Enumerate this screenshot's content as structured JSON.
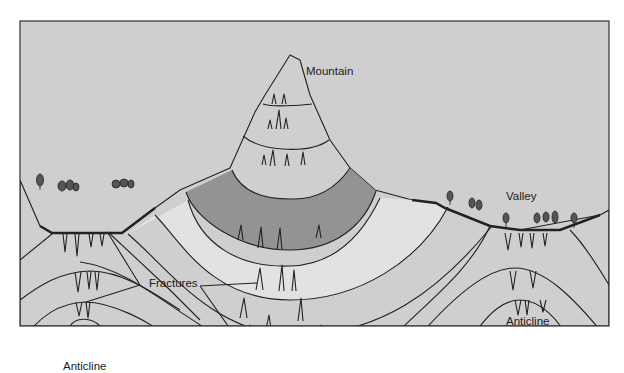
{
  "diagram": {
    "type": "geologic-cross-section",
    "colors": {
      "sky": "#cfcfcf",
      "frame": "#333333",
      "layer_mid": "#acacac",
      "layer_dark": "#939393",
      "layer_light": "#e2e2e2",
      "layer_top": "#a6a6a6",
      "line": "#222222"
    },
    "labels": {
      "mountain": "Mountain",
      "valley": "Valley",
      "fractures": "Fractures",
      "anticline_left": "Anticline",
      "anticline_right": "Anticline"
    },
    "features": [
      {
        "name": "Mountain",
        "description": "Folded layered rock forming a syncline that stands as a mountain peak"
      },
      {
        "name": "Valley",
        "description": "Low ground with trees above an eroded anticline"
      },
      {
        "name": "Fractures",
        "description": "Tension cracks along outer edges of folded layers"
      },
      {
        "name": "Anticline",
        "description": "Upward arched rock layers beneath valleys"
      }
    ]
  }
}
